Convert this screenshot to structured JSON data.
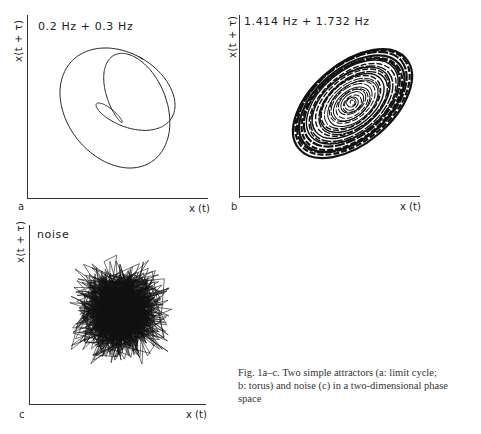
{
  "figure": {
    "caption": "Fig. 1a–c. Two simple attractors (a: limit cycle; b: torus) and noise (c) in a two-dimensional phase space",
    "caption_lines": [
      "Fig. 1a–c. Two simple attractors (a: limit cycle;",
      "b: torus) and noise (c) in a two-dimensional phase",
      "space"
    ]
  },
  "panels": [
    {
      "letter": "a",
      "title": "0.2 Hz + 0.3 Hz",
      "xlabel": "x (t)",
      "ylabel": "x(t + τ)",
      "kind": "limit cycle",
      "frequencies_hz": [
        0.2,
        0.3
      ]
    },
    {
      "letter": "b",
      "title": "1.414 Hz + 1.732 Hz",
      "xlabel": "x (t)",
      "ylabel": "x(t + τ)",
      "kind": "torus",
      "frequencies_hz": [
        1.414,
        1.732
      ]
    },
    {
      "letter": "c",
      "title": "noise",
      "xlabel": "x (t)",
      "ylabel": "x(t + τ)",
      "kind": "noise"
    }
  ],
  "chart_data": [
    {
      "type": "line",
      "title": "0.2 Hz + 0.3 Hz",
      "xlabel": "x (t)",
      "ylabel": "x(t + τ)",
      "description": "Closed limit-cycle trajectory of a sum of two sinusoids (0.2 Hz and 0.3 Hz) in delay-embedded phase space; three-lobed crossing loop",
      "grid": false,
      "ticks": false
    },
    {
      "type": "line",
      "title": "1.414 Hz + 1.732 Hz",
      "xlabel": "x (t)",
      "ylabel": "x(t + τ)",
      "description": "Quasi-periodic torus trajectory filling an elliptical band oriented along the diagonal",
      "grid": false,
      "ticks": false
    },
    {
      "type": "scatter",
      "title": "noise",
      "xlabel": "x (t)",
      "ylabel": "x(t + τ)",
      "description": "Random noise trajectory densely filling a roughly square region",
      "grid": false,
      "ticks": false
    }
  ]
}
